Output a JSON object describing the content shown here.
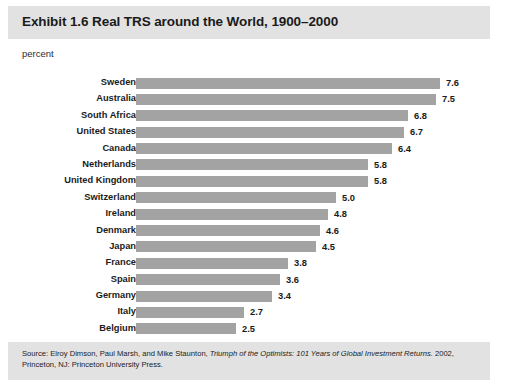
{
  "exhibit": {
    "title": "Exhibit 1.6 Real TRS around the World, 1900–2000",
    "axis_unit_label": "percent",
    "source_prefix": "Source: Elroy Dimson, Paul Marsh, and Mike Staunton, ",
    "source_italic": "Triumph of the Optimists: 101 Years of Global Investment Returns.",
    "source_suffix": " 2002, Princeton, NJ: Princeton University Press.",
    "band_color": "#e2e2e2",
    "bar_color": "#a3a3a3",
    "text_color": "#1b1b1b"
  },
  "chart_data": {
    "type": "bar",
    "orientation": "horizontal",
    "title": "Exhibit 1.6 Real TRS around the World, 1900–2000",
    "xlabel": "percent",
    "ylabel": "",
    "xlim": [
      0,
      8.5
    ],
    "grid": false,
    "legend": "none",
    "categories": [
      "Sweden",
      "Australia",
      "South Africa",
      "United States",
      "Canada",
      "Netherlands",
      "United Kingdom",
      "Switzerland",
      "Ireland",
      "Denmark",
      "Japan",
      "France",
      "Spain",
      "Germany",
      "Italy",
      "Belgium"
    ],
    "values": [
      7.6,
      7.5,
      6.8,
      6.7,
      6.4,
      5.8,
      5.8,
      5.0,
      4.8,
      4.6,
      4.5,
      3.8,
      3.6,
      3.4,
      2.7,
      2.5
    ],
    "value_labels": [
      "7.6",
      "7.5",
      "6.8",
      "6.7",
      "6.4",
      "5.8",
      "5.8",
      "5.0",
      "4.8",
      "4.6",
      "4.5",
      "3.8",
      "3.6",
      "3.4",
      "2.7",
      "2.5"
    ]
  }
}
